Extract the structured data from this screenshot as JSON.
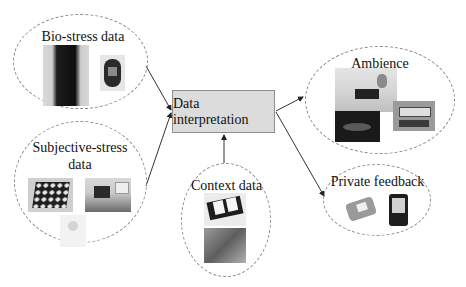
{
  "diagram": {
    "central_node": {
      "label": "Data interpretation",
      "fill": "#dcdcdc"
    },
    "inputs": [
      {
        "label": "Bio-stress data",
        "images": [
          "body-sensor-vest",
          "wrist-watch-sensor"
        ]
      },
      {
        "label_line1": "Subjective-stress",
        "label_line2": "data",
        "images": [
          "button-panel-device",
          "desk-device",
          "handheld-device"
        ]
      },
      {
        "label": "Context data",
        "images": [
          "pda-device",
          "circuit-board"
        ]
      }
    ],
    "outputs": [
      {
        "label": "Ambience",
        "images": [
          "living-room-scene",
          "ambient-lamp",
          "display-clock"
        ]
      },
      {
        "label": "Private feedback",
        "images": [
          "wrist-display-device",
          "mobile-phone"
        ]
      }
    ],
    "edges": [
      {
        "from": "Bio-stress data",
        "to": "Data interpretation"
      },
      {
        "from": "Subjective-stress data",
        "to": "Data interpretation"
      },
      {
        "from": "Context data",
        "to": "Data interpretation"
      },
      {
        "from": "Data interpretation",
        "to": "Ambience"
      },
      {
        "from": "Data interpretation",
        "to": "Private feedback"
      }
    ],
    "colors": {
      "edge": "#333333",
      "ellipse_border": "#8a8a8a",
      "box_border": "#8e8e8e"
    }
  }
}
